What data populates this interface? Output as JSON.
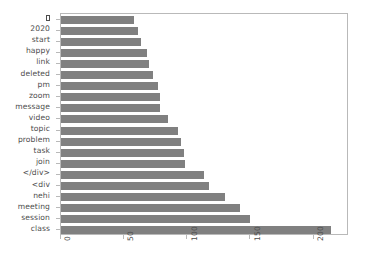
{
  "chart_data": {
    "type": "bar",
    "orientation": "horizontal",
    "title": "",
    "xlabel": "",
    "ylabel": "",
    "xlim": [
      0,
      228
    ],
    "xticks": [
      0,
      50,
      100,
      150,
      200
    ],
    "xtick_labels": [
      "0",
      "50",
      "100",
      "150",
      "200"
    ],
    "grid": false,
    "legend": null,
    "bar_color": "#808080",
    "axes_color": "#b9b9b9",
    "text_color": "#4d4d4d",
    "background": "#ffffff",
    "categories": [
      "□",
      "2020",
      "start",
      "happy",
      "link",
      "deleted",
      "pm",
      "zoom",
      "message",
      "video",
      "topic",
      "problem",
      "task",
      "join",
      "</div>",
      "<div",
      "nehi",
      "meeting",
      "session",
      "class"
    ],
    "values": [
      58,
      61,
      63,
      68,
      70,
      73,
      77,
      78,
      78,
      85,
      93,
      95,
      97,
      98,
      113,
      117,
      130,
      142,
      150,
      214
    ]
  }
}
